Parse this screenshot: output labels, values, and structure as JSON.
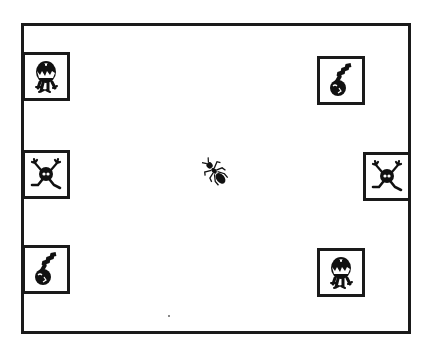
{
  "scene": {
    "background": "#ffffff",
    "stroke_color": "#1a1a1a",
    "arena": {
      "x": 21,
      "y": 23,
      "width": 387,
      "height": 308
    },
    "center_character": {
      "type": "ant",
      "icon": "ant-icon",
      "x": 216,
      "y": 173,
      "orientation": "diagonal"
    },
    "tiles": [
      {
        "id": "left-top",
        "creature": "chomper",
        "icon": "chomper-monster-icon",
        "x": 22,
        "y": 52
      },
      {
        "id": "left-middle",
        "creature": "spider",
        "icon": "spider-monster-icon",
        "x": 22,
        "y": 150
      },
      {
        "id": "left-bottom",
        "creature": "bomb",
        "icon": "bomb-creature-icon",
        "x": 22,
        "y": 245
      },
      {
        "id": "right-top",
        "creature": "bomb",
        "icon": "bomb-creature-icon",
        "x": 317,
        "y": 56
      },
      {
        "id": "right-middle",
        "creature": "spider",
        "icon": "spider-monster-icon",
        "x": 363,
        "y": 152
      },
      {
        "id": "right-bottom",
        "creature": "chomper",
        "icon": "chomper-monster-icon",
        "x": 317,
        "y": 248
      }
    ]
  }
}
